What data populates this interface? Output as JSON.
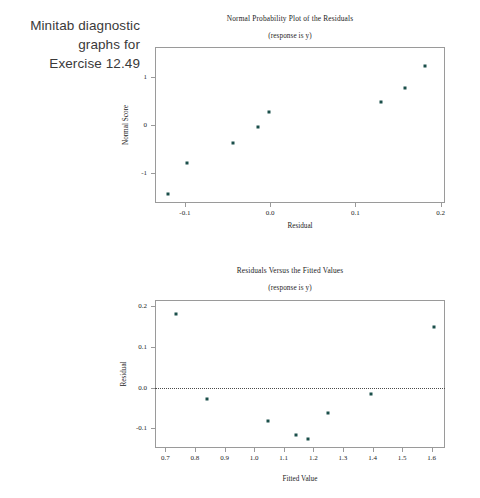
{
  "caption": {
    "lines": [
      "Minitab diagnostic",
      "graphs for",
      "Exercise 12.49"
    ]
  },
  "chart_data": [
    {
      "id": "normal-probability-plot",
      "type": "scatter",
      "title": "Normal Probability Plot of the Residuals",
      "subtitle": "(response is y)",
      "xlabel": "Residual",
      "ylabel": "Normal Score",
      "xlim": [
        -0.135,
        0.205
      ],
      "ylim": [
        -1.62,
        1.62
      ],
      "xticks": [
        -0.1,
        0.0,
        0.1,
        0.2
      ],
      "xticklabels": [
        "-0.1",
        "0.0",
        "0.1",
        "0.2"
      ],
      "yticks": [
        -1,
        0,
        1
      ],
      "yticklabels": [
        "-1",
        "0",
        "1"
      ],
      "grid": false,
      "legend": null,
      "points": [
        {
          "x": -0.12,
          "y": -1.43
        },
        {
          "x": -0.097,
          "y": -0.78
        },
        {
          "x": -0.043,
          "y": -0.37
        },
        {
          "x": -0.014,
          "y": -0.04
        },
        {
          "x": -0.001,
          "y": 0.26
        },
        {
          "x": 0.158,
          "y": 0.77
        },
        {
          "x": 0.182,
          "y": 1.23
        },
        {
          "x": 0.13,
          "y": 0.48
        }
      ],
      "marker_color": "#1b4f4a"
    },
    {
      "id": "residuals-versus-fitted-values",
      "type": "scatter",
      "title": "Residuals Versus the Fitted Values",
      "subtitle": "(response is y)",
      "xlabel": "Fitted Value",
      "ylabel": "Residual",
      "xlim": [
        0.665,
        1.645
      ],
      "ylim": [
        -0.148,
        0.215
      ],
      "xticks": [
        0.7,
        0.8,
        0.9,
        1.0,
        1.1,
        1.2,
        1.3,
        1.4,
        1.5,
        1.6
      ],
      "xticklabels": [
        "0.7",
        "0.8",
        "0.9",
        "1.0",
        "1.1",
        "1.2",
        "1.3",
        "1.4",
        "1.5",
        "1.6"
      ],
      "yticks": [
        -0.1,
        0.0,
        0.1,
        0.2
      ],
      "yticklabels": [
        "-0.1",
        "0.0",
        "0.1",
        "0.2"
      ],
      "grid": false,
      "legend": null,
      "reference_line": {
        "y": 0.0,
        "style": "dotted"
      },
      "points": [
        {
          "x": 0.737,
          "y": 0.18
        },
        {
          "x": 0.84,
          "y": -0.029
        },
        {
          "x": 1.046,
          "y": -0.082
        },
        {
          "x": 1.142,
          "y": -0.116
        },
        {
          "x": 1.25,
          "y": -0.061
        },
        {
          "x": 1.395,
          "y": -0.016
        },
        {
          "x": 1.607,
          "y": 0.149
        },
        {
          "x": 1.182,
          "y": -0.127
        }
      ],
      "marker_color": "#1b4f4a"
    }
  ]
}
